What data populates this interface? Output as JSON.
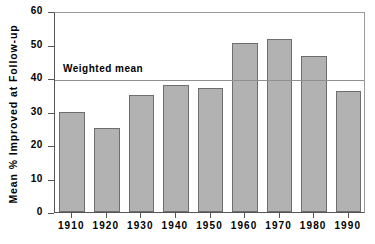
{
  "chart_data": {
    "type": "bar",
    "title": "",
    "xlabel": "",
    "ylabel": "Mean % Improved at Follow-up",
    "categories": [
      "1910",
      "1920",
      "1930",
      "1940",
      "1950",
      "1960",
      "1970",
      "1980",
      "1990"
    ],
    "values": [
      30,
      25,
      35,
      38,
      37,
      50.5,
      51.5,
      46.5,
      36
    ],
    "ylim": [
      0,
      60
    ],
    "ytick_labels": [
      "0",
      "10",
      "20",
      "30",
      "40",
      "50",
      "60"
    ],
    "ytick_values": [
      0,
      10,
      20,
      30,
      40,
      50,
      60
    ],
    "grid": false,
    "legend": "none",
    "annotations": [
      {
        "name": "weighted-mean",
        "label": "Weighted mean",
        "value": 40,
        "style": "horizontal-reference-line"
      }
    ],
    "colors": {
      "bar_fill": "#b2b2b2",
      "bar_border": "#6e6e6e",
      "axis": "#555555",
      "mean_line": "#8f8f8f",
      "text": "#000000",
      "background": "#ffffff"
    }
  }
}
